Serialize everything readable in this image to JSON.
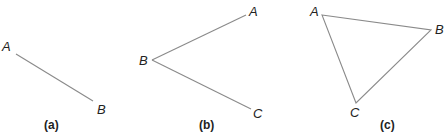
{
  "figures": [
    {
      "caption": "(a)",
      "type": "line segment",
      "points": {
        "A": "A",
        "B": "B"
      }
    },
    {
      "caption": "(b)",
      "type": "angle",
      "points": {
        "A": "A",
        "B": "B",
        "C": "C"
      }
    },
    {
      "caption": "(c)",
      "type": "triangle",
      "points": {
        "A": "A",
        "B": "B",
        "C": "C"
      }
    }
  ],
  "colors": {
    "line": "#8a8a8a",
    "text": "#222222"
  }
}
